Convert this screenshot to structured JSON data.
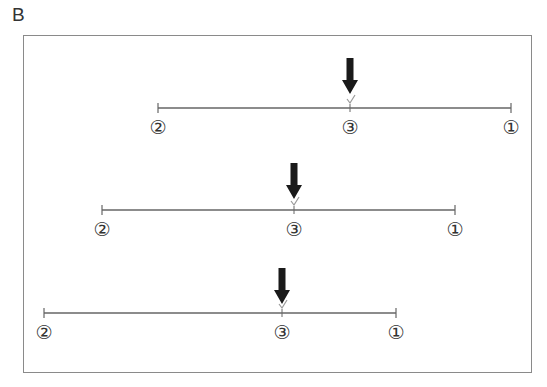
{
  "panel": {
    "label": "B"
  },
  "colors": {
    "line": "#666666",
    "arrow": "#1a1a1a",
    "check": "#9a9a9a",
    "frame": "#8a8a8a",
    "text": "#333333"
  },
  "rows": [
    {
      "line_y": 108,
      "x_start": 158,
      "x_end": 511,
      "arrow_x": 350,
      "arrow_top": 58,
      "labels": [
        {
          "text": "②",
          "x": 158
        },
        {
          "text": "③",
          "x": 350
        },
        {
          "text": "①",
          "x": 511
        }
      ]
    },
    {
      "line_y": 210,
      "x_start": 102,
      "x_end": 455,
      "arrow_x": 294,
      "arrow_top": 163,
      "labels": [
        {
          "text": "②",
          "x": 102
        },
        {
          "text": "③",
          "x": 294
        },
        {
          "text": "①",
          "x": 455
        }
      ]
    },
    {
      "line_y": 313,
      "x_start": 44,
      "x_end": 396,
      "arrow_x": 282,
      "arrow_top": 268,
      "labels": [
        {
          "text": "②",
          "x": 44
        },
        {
          "text": "③",
          "x": 282
        },
        {
          "text": "①",
          "x": 396
        }
      ]
    }
  ]
}
